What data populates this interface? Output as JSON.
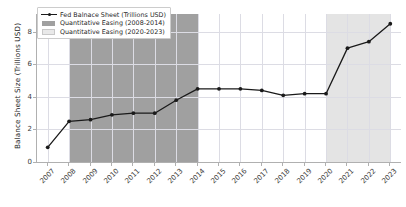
{
  "chart_data": {
    "type": "line",
    "title": "",
    "xlabel": "",
    "ylabel": "Balance Sheet Size (Trillions USD)",
    "x": [
      2007,
      2008,
      2009,
      2010,
      2011,
      2012,
      2013,
      2014,
      2015,
      2016,
      2017,
      2018,
      2019,
      2020,
      2021,
      2022,
      2023
    ],
    "xtick_labels": [
      "2007",
      "2008",
      "2009",
      "2010",
      "2011",
      "2012",
      "2013",
      "2014",
      "2015",
      "2016",
      "2017",
      "2018",
      "2019",
      "2020",
      "2021",
      "2022",
      "2023"
    ],
    "ytick_labels": [
      "0",
      "2",
      "4",
      "6",
      "8"
    ],
    "ytick_values": [
      0,
      2,
      4,
      6,
      8
    ],
    "series": [
      {
        "name": "Fed Balnace Sheet (Trillions USD)",
        "color": "#1a1a1a",
        "marker": "circle",
        "values": [
          0.9,
          2.5,
          2.6,
          2.9,
          3.0,
          3.0,
          3.8,
          4.5,
          4.5,
          4.5,
          4.4,
          4.1,
          4.2,
          4.2,
          7.0,
          7.4,
          8.5
        ]
      }
    ],
    "shaded_regions": [
      {
        "name": "Quantitative Easing (2008-2014)",
        "start": 2008,
        "end": 2014,
        "color": "#a0a0a0"
      },
      {
        "name": "Quantitative Easing (2020-2023)",
        "start": 2020,
        "end": 2023,
        "color": "#e4e4e4"
      }
    ],
    "xlim": [
      2006.5,
      2023.5
    ],
    "ylim": [
      0,
      9.1
    ],
    "grid": true,
    "legend_position": "upper left"
  },
  "legend": {
    "items": [
      {
        "label": "Fed Balnace Sheet (Trillions USD)",
        "key": "line"
      },
      {
        "label": "Quantitative Easing (2008-2014)",
        "key": "swatch-qe1"
      },
      {
        "label": "Quantitative Easing (2020-2023)",
        "key": "swatch-qe2"
      }
    ]
  },
  "axes": {
    "ylabel": "Balance Sheet Size (Trillions USD)"
  }
}
